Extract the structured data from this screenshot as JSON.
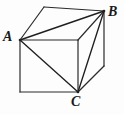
{
  "figure": {
    "kind": "geometry-diagram",
    "width": 124,
    "height": 114,
    "background_color": "#fdfdfd",
    "stroke_color": "#2b2b2b",
    "stroke_width": 1.2,
    "labels": [
      {
        "id": "A",
        "text": "A",
        "x": 3,
        "y": 30
      },
      {
        "id": "B",
        "text": "B",
        "x": 108,
        "y": 5
      },
      {
        "id": "C",
        "text": "C",
        "x": 71,
        "y": 95
      }
    ],
    "vertices": {
      "front_top_left": {
        "name": "A",
        "x": 20,
        "y": 40
      },
      "front_top_right": {
        "name": "D",
        "x": 78,
        "y": 40
      },
      "front_bottom_right": {
        "name": "C",
        "x": 78,
        "y": 92
      },
      "front_bottom_left": {
        "name": "E",
        "x": 20,
        "y": 92
      },
      "back_top_left": {
        "name": "F",
        "x": 44,
        "y": 7
      },
      "back_top_right": {
        "name": "B",
        "x": 104,
        "y": 11
      },
      "back_bottom_right": {
        "name": "G",
        "x": 104,
        "y": 66
      }
    },
    "edges": [
      {
        "name": "front-face-top",
        "from": "front_top_left",
        "to": "front_top_right"
      },
      {
        "name": "front-face-right",
        "from": "front_top_right",
        "to": "front_bottom_right"
      },
      {
        "name": "front-face-bottom",
        "from": "front_bottom_right",
        "to": "front_bottom_left"
      },
      {
        "name": "front-face-left",
        "from": "front_bottom_left",
        "to": "front_top_left"
      },
      {
        "name": "top-face-back-left",
        "from": "front_top_left",
        "to": "back_top_left"
      },
      {
        "name": "top-face-back",
        "from": "back_top_left",
        "to": "back_top_right"
      },
      {
        "name": "top-face-right",
        "from": "back_top_right",
        "to": "front_top_right"
      },
      {
        "name": "right-face-back",
        "from": "back_top_right",
        "to": "back_bottom_right"
      },
      {
        "name": "right-face-bottom",
        "from": "back_bottom_right",
        "to": "front_bottom_right"
      }
    ],
    "triangle": {
      "name": "triangle-ABC",
      "sides": [
        {
          "name": "side-AB",
          "from": "front_top_left",
          "to": "back_top_right"
        },
        {
          "name": "side-BC",
          "from": "back_top_right",
          "to": "front_bottom_right"
        },
        {
          "name": "side-CA",
          "from": "front_bottom_right",
          "to": "front_top_left"
        }
      ]
    }
  }
}
